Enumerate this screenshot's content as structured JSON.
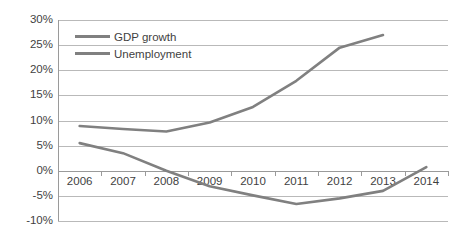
{
  "chart_data": {
    "type": "line",
    "title": "",
    "xlabel": "",
    "ylabel": "",
    "categories": [
      "2006",
      "2007",
      "2008",
      "2009",
      "2010",
      "2011",
      "2012",
      "2013",
      "2014"
    ],
    "ylim": [
      -10,
      30
    ],
    "ytick_labels": [
      "30%",
      "25%",
      "20%",
      "15%",
      "10%",
      "5%",
      "0%",
      "-5%",
      "-10%"
    ],
    "ytick_values": [
      30,
      25,
      20,
      15,
      10,
      5,
      0,
      -5,
      -10
    ],
    "grid": true,
    "legend_position": "top-left",
    "series": [
      {
        "name": "GDP growth",
        "color": "#808080",
        "x": [
          "2006",
          "2007",
          "2008",
          "2009",
          "2010",
          "2011",
          "2012",
          "2013",
          "2014"
        ],
        "values": [
          5.5,
          3.5,
          0.0,
          -3.1,
          -4.9,
          -6.6,
          -5.5,
          -4.0,
          0.7
        ]
      },
      {
        "name": "Unemployment",
        "color": "#808080",
        "x": [
          "2006",
          "2007",
          "2008",
          "2009",
          "2010",
          "2011",
          "2012",
          "2013"
        ],
        "values": [
          8.9,
          8.3,
          7.8,
          9.6,
          12.7,
          17.9,
          24.5,
          27.0
        ]
      }
    ]
  },
  "legend": {
    "items": [
      {
        "label": "GDP growth"
      },
      {
        "label": "Unemployment"
      }
    ]
  },
  "colors": {
    "line": "#808080",
    "grid": "#b9b9b9",
    "axis": "#9a9a9a",
    "text": "#3f3f3f",
    "background": "#ffffff"
  }
}
